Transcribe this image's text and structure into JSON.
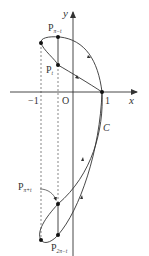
{
  "diagram": {
    "type": "parametric-curve",
    "curve_label": "C",
    "axes": {
      "x_label": "x",
      "y_label": "y",
      "origin_label": "O",
      "x_ticks": [
        {
          "value": -1,
          "label": "−1"
        },
        {
          "value": 1,
          "label": "1"
        }
      ]
    },
    "points": [
      {
        "id": "p-pi-minus-t",
        "label": "P",
        "subscript": "π−t"
      },
      {
        "id": "p-t",
        "label": "P",
        "subscript": "t"
      },
      {
        "id": "p-pi-plus-t",
        "label": "P",
        "subscript": "π+t"
      },
      {
        "id": "p-2pi-minus-t",
        "label": "P",
        "subscript": "2π−t"
      },
      {
        "id": "p-one-zero",
        "label": ""
      },
      {
        "id": "p-leftmost-top",
        "label": ""
      },
      {
        "id": "p-leftmost-bottom",
        "label": ""
      }
    ],
    "colors": {
      "stroke": "#333333",
      "background": "#ffffff"
    }
  }
}
